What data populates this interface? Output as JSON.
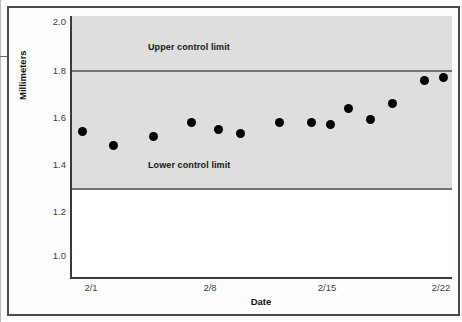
{
  "chart_data": {
    "type": "scatter",
    "title": "",
    "xlabel": "Date",
    "ylabel": "Millimeters",
    "ylim": [
      0.9,
      2.05
    ],
    "yticks": [
      "2.0",
      "1.8",
      "1.6",
      "1.4",
      "1.2",
      "1.0"
    ],
    "ytick_values": [
      2.0,
      1.8,
      1.6,
      1.4,
      1.2,
      1.0
    ],
    "xticks": [
      "2/1",
      "2/8",
      "2/15",
      "2/22"
    ],
    "xtick_values": [
      1,
      8,
      15,
      22
    ],
    "grid": false,
    "legend": false,
    "series": [
      {
        "name": "Measurement",
        "marker": "filled-circle",
        "color": "#000000",
        "x": [
          0.5,
          2.3,
          4.7,
          6.9,
          8.5,
          9.8,
          12.1,
          14.0,
          15.1,
          16.2,
          17.5,
          18.8,
          20.7,
          21.8
        ],
        "values": [
          1.53,
          1.47,
          1.51,
          1.57,
          1.54,
          1.52,
          1.57,
          1.57,
          1.56,
          1.63,
          1.58,
          1.65,
          1.75,
          1.76
        ]
      }
    ],
    "reference_lines": [
      {
        "id": "upper",
        "label": "Upper control limit",
        "value": 1.8,
        "color": "#737373"
      },
      {
        "id": "lower",
        "label": "Lower control limit",
        "value": 1.3,
        "color": "#737373"
      }
    ],
    "shaded_band": {
      "from": 1.3,
      "to": 2.05,
      "color": "#dedede"
    }
  },
  "colors": {
    "marker": "#000000",
    "limit_line": "#737373",
    "shade": "#dedede",
    "axis": "#3a3a3a",
    "frame": "#4a4a4a"
  }
}
